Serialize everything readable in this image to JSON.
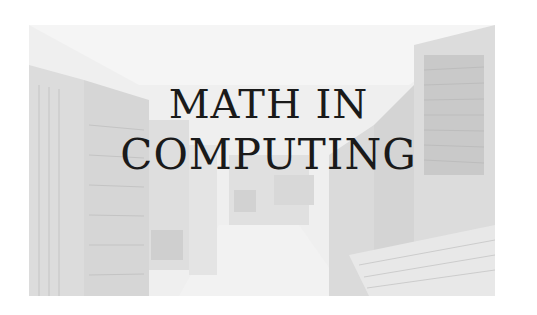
{
  "image": {
    "description": "faded grayscale photograph of a vintage computer room with tall cabinet machines and panels along a corridor",
    "title_lines": [
      "MATH IN",
      "COMPUTING"
    ],
    "colors": {
      "background": "#ffffff",
      "photo_tone": "#e6e6e6",
      "text": "#1a1a1a"
    }
  }
}
